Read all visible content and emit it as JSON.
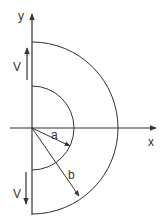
{
  "diagram": {
    "type": "half-annulus velocity field",
    "axes": {
      "x_label": "x",
      "y_label": "y"
    },
    "regions": {
      "inner_radius_label": "a",
      "outer_radius_label": "b"
    },
    "velocity": {
      "upper_label": "V",
      "lower_label": "V",
      "upper_direction": "up",
      "lower_direction": "down"
    },
    "colors": {
      "stroke": "#333333",
      "background": "#ffffff"
    }
  }
}
